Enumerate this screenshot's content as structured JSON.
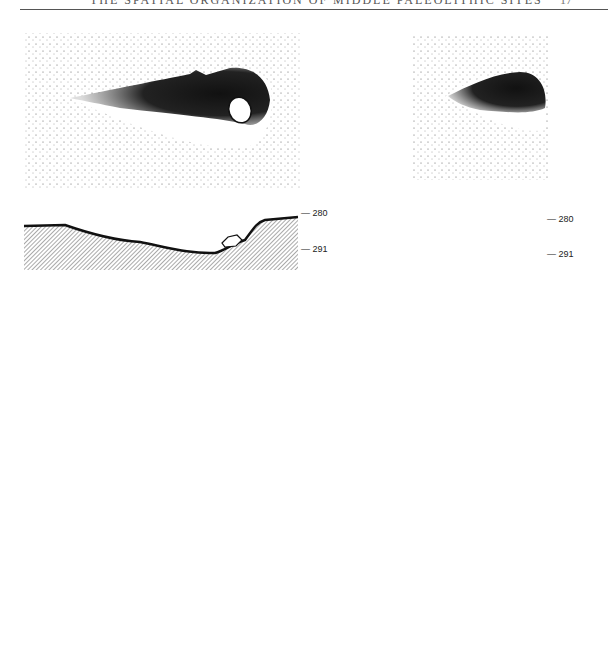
{
  "header": {
    "running_title": "THE SPATIAL ORGANIZATION OF MIDDLE PALEOLITHIC SITES",
    "page_number": "17"
  },
  "figure": {
    "top_left_plan": {
      "description": "stippled plan view of elongated dark pit with boulder"
    },
    "top_right_plan": {
      "description": "stippled plan view of dark oval pit"
    },
    "left_section": {
      "depth_labels": [
        "— 280",
        "— 291"
      ]
    },
    "right_section": {
      "depth_labels": [
        "— 280",
        "— 291"
      ]
    },
    "bottom_plan": {
      "description": "stippled areas with boulders, hearth (cross-hatched), dark nodules"
    }
  }
}
